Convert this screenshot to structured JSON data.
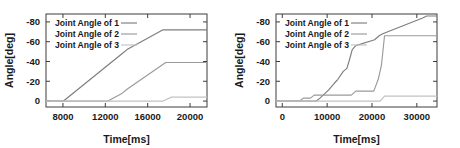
{
  "figure": {
    "background": "#ffffff",
    "panel_count": 2
  },
  "chart_data": [
    {
      "id": "left-chart",
      "type": "line",
      "title": "",
      "xlabel": "Time[ms]",
      "ylabel": "Angle[deg]",
      "xlim": [
        6400,
        21600
      ],
      "ylim": [
        -88,
        6
      ],
      "yaxis_inverted": true,
      "grid": false,
      "legend_position": "top-left",
      "xticks": [
        8000,
        12000,
        16000,
        20000
      ],
      "xtick_labels": [
        "8000",
        "12000",
        "16000",
        "20000"
      ],
      "yticks": [
        -80,
        -60,
        -40,
        -20,
        0
      ],
      "ytick_labels": [
        "-80",
        "-60",
        "-40",
        "-20",
        "0"
      ],
      "series": [
        {
          "name": "Joint Angle of 1",
          "color": "#7d7d7d",
          "x": [
            6400,
            8050,
            13600,
            14050,
            17450,
            21600
          ],
          "y": [
            0,
            0,
            -48,
            -52,
            -72,
            -72
          ]
        },
        {
          "name": "Joint Angle of 2",
          "color": "#9a9a9a",
          "x": [
            6400,
            12250,
            13600,
            14050,
            17700,
            21600
          ],
          "y": [
            0,
            0,
            -8,
            -12,
            -39,
            -39
          ]
        },
        {
          "name": "Joint Angle of 3",
          "color": "#c2c2c2",
          "x": [
            6400,
            17450,
            18250,
            21600
          ],
          "y": [
            0,
            0,
            -4,
            -4
          ]
        }
      ]
    },
    {
      "id": "right-chart",
      "type": "line",
      "title": "",
      "xlabel": "Time[ms]",
      "ylabel": "Angle[deg]",
      "xlim": [
        -1400,
        34500
      ],
      "ylim": [
        -88,
        6
      ],
      "yaxis_inverted": true,
      "grid": false,
      "legend_position": "top-left",
      "xticks": [
        0,
        10000,
        20000,
        30000
      ],
      "xtick_labels": [
        "0",
        "10000",
        "20000",
        "30000"
      ],
      "yticks": [
        -80,
        -60,
        -40,
        -20,
        0
      ],
      "ytick_labels": [
        "-80",
        "-60",
        "-40",
        "-20",
        "0"
      ],
      "series": [
        {
          "name": "Joint Angle of 1",
          "color": "#7d7d7d",
          "x": [
            -1400,
            7600,
            8400,
            9600,
            10300,
            11600,
            12400,
            13600,
            14400,
            15000,
            15600,
            16400,
            20600,
            21600,
            22400,
            31300,
            32200,
            34500
          ],
          "y": [
            0,
            0,
            -3,
            -8,
            -11,
            -18,
            -22,
            -30,
            -33,
            -42,
            -52,
            -56,
            -62,
            -66,
            -68,
            -84,
            -86,
            -86
          ]
        },
        {
          "name": "Joint Angle of 2",
          "color": "#9a9a9a",
          "x": [
            -1400,
            3900,
            4700,
            6300,
            7100,
            15400,
            16400,
            20400,
            21400,
            22100,
            22800,
            34500
          ],
          "y": [
            0,
            0,
            -3,
            -3,
            -6,
            -6,
            -10,
            -10,
            -22,
            -36,
            -66,
            -66
          ]
        },
        {
          "name": "Joint Angle of 3",
          "color": "#c2c2c2",
          "x": [
            -1400,
            21800,
            22800,
            34500
          ],
          "y": [
            0,
            0,
            -5,
            -5
          ]
        }
      ]
    }
  ]
}
